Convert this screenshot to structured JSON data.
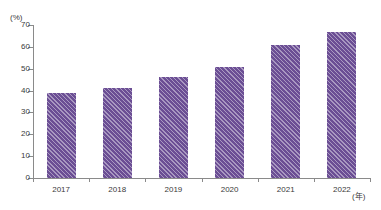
{
  "chart_data": {
    "type": "bar",
    "title": "",
    "subtitle": "",
    "xlabel": "(年)",
    "ylabel": "(%)",
    "categories": [
      "2017",
      "2018",
      "2019",
      "2020",
      "2021",
      "2022"
    ],
    "values": [
      39,
      41,
      46,
      51,
      61,
      67
    ],
    "series": [
      {
        "name": "",
        "values": [
          39,
          41,
          46,
          51,
          61,
          67
        ]
      }
    ],
    "ylim": [
      0,
      70
    ],
    "y_ticks": [
      0,
      10,
      20,
      30,
      40,
      50,
      60,
      70
    ],
    "y_tick_labels": [
      "0",
      "10",
      "20",
      "30",
      "40",
      "50",
      "60",
      "70"
    ],
    "grid": false,
    "legend": "none",
    "annotations": [],
    "colors": {
      "bar_fill": "#6b4e94",
      "bar_hatch": "#ffffff",
      "axis": "#8a8a8a",
      "text": "#3a3a3a",
      "background": "#ffffff"
    }
  }
}
